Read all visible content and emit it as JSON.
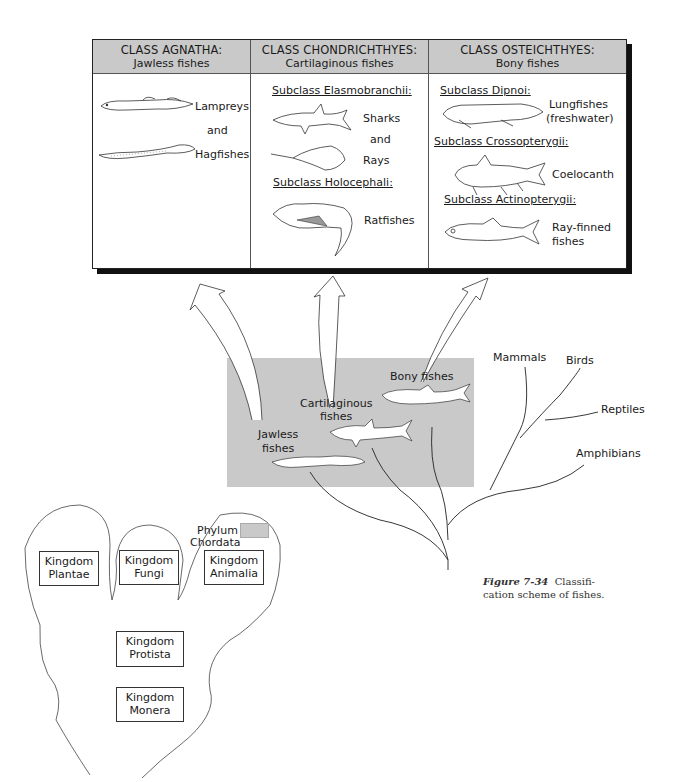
{
  "table": {
    "columns": [
      {
        "title": "CLASS AGNATHA:",
        "subtitle": "Jawless fishes",
        "labels": [
          "Lampreys",
          "and",
          "Hagfishes"
        ]
      },
      {
        "title": "CLASS CHONDRICHTHYES:",
        "subtitle": "Cartilaginous fishes",
        "subclasses": [
          {
            "name": "Subclass Elasmobranchii:",
            "labels": [
              "Sharks",
              "and",
              "Rays"
            ]
          },
          {
            "name": "Subclass Holocephali:",
            "labels": [
              "Ratfishes"
            ]
          }
        ]
      },
      {
        "title": "CLASS OSTEICHTHYES:",
        "subtitle": "Bony fishes",
        "subclasses": [
          {
            "name": "Subclass Dipnoi:",
            "labels": [
              "Lungfishes",
              "(freshwater)"
            ]
          },
          {
            "name": "Subclass Crossopterygii:",
            "labels": [
              "Coelocanth"
            ]
          },
          {
            "name": "Subclass Actinopterygii:",
            "labels": [
              "Ray-finned",
              "fishes"
            ]
          }
        ]
      }
    ]
  },
  "tree": {
    "fish_groups": [
      "Bony fishes",
      "Cartilaginous",
      "fishes",
      "Jawless",
      "fishes"
    ],
    "vertebrate_branches": [
      "Mammals",
      "Birds",
      "Reptiles",
      "Amphibians"
    ]
  },
  "kingdoms": {
    "legend": {
      "line1": "Phylum",
      "line2": "Chordata",
      "swatch_color": "#c9c9c9"
    },
    "boxes": [
      {
        "line1": "Kingdom",
        "line2": "Plantae"
      },
      {
        "line1": "Kingdom",
        "line2": "Fungi"
      },
      {
        "line1": "Kingdom",
        "line2": "Animalia"
      },
      {
        "line1": "Kingdom",
        "line2": "Protista"
      },
      {
        "line1": "Kingdom",
        "line2": "Monera"
      }
    ]
  },
  "caption": {
    "figure_label": "Figure 7-34",
    "text_line1": "Classifi-",
    "text_line2": "cation scheme of fishes."
  },
  "colors": {
    "shade": "#c9c9c9",
    "line": "#222222"
  }
}
